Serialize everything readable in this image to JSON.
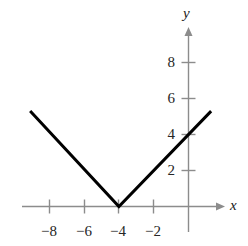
{
  "figure": {
    "background_color": "#ffffff",
    "width": 248,
    "height": 246
  },
  "axes": {
    "x_axis_label": "x",
    "y_axis_label": "y",
    "axis_color": "#8c8c8c",
    "tick_color": "#8c8c8c",
    "curve_color": "#000000"
  },
  "labels": {
    "x_ticks": [
      "−8",
      "−6",
      "−4",
      "−2"
    ],
    "y_ticks": [
      "8",
      "6",
      "4",
      "2"
    ]
  },
  "chart_data": {
    "type": "line",
    "title": "",
    "xlabel": "x",
    "ylabel": "y",
    "function": "y = |x + 4|",
    "xlim": [
      -10.4,
      2.3
    ],
    "ylim": [
      -1.4,
      9.8
    ],
    "xticks": [
      -8,
      -6,
      -4,
      -2
    ],
    "yticks": [
      2,
      4,
      6,
      8
    ],
    "xtick_labels": [
      "−8",
      "−6",
      "−4",
      "−2"
    ],
    "ytick_labels": [
      "2",
      "4",
      "6",
      "8"
    ],
    "grid": false,
    "legend": null,
    "series": [
      {
        "name": "y = |x + 4|",
        "color": "#000000",
        "linewidth": 3,
        "x": [
          -9.1,
          -4,
          1.3
        ],
        "y": [
          5.3,
          0,
          5.3
        ]
      }
    ],
    "annotations": [
      {
        "text": "vertex",
        "x": -4,
        "y": 0
      },
      {
        "text": "y-intercept",
        "x": 0,
        "y": 4
      }
    ]
  }
}
